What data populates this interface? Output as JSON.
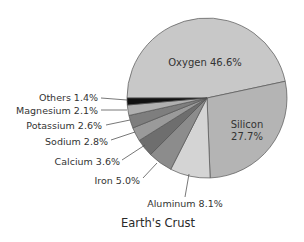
{
  "chart_data": {
    "type": "pie",
    "title": "Earth's Crust",
    "categories": [
      "Oxygen",
      "Silicon",
      "Aluminum",
      "Iron",
      "Calcium",
      "Sodium",
      "Potassium",
      "Magnesium",
      "Others"
    ],
    "values": [
      46.6,
      27.7,
      8.1,
      5.0,
      3.6,
      2.8,
      2.6,
      2.1,
      1.4
    ],
    "unit": "%",
    "labels": [
      "Oxygen 46.6%",
      "Silicon 27.7%",
      "Aluminum 8.1%",
      "Iron 5.0%",
      "Calcium 3.6%",
      "Sodium 2.8%",
      "Potassium 2.6%",
      "Magnesium 2.1%",
      "Others 1.4%"
    ],
    "colors": [
      "#c8c8c8",
      "#b4b4b4",
      "#d4d4d4",
      "#8c8c8c",
      "#6e6e6e",
      "#9a9a9a",
      "#7e7e7e",
      "#b0b0b0",
      "#111111"
    ],
    "legend": "none (callout labels)",
    "start_angle_deg": 180,
    "direction": "clockwise"
  },
  "labels": {
    "oxygen": "Oxygen 46.6%",
    "silicon_name": "Silicon",
    "silicon_value": "27.7%",
    "aluminum": "Aluminum 8.1%",
    "iron": "Iron 5.0%",
    "calcium": "Calcium 3.6%",
    "sodium": "Sodium 2.8%",
    "potassium": "Potassium 2.6%",
    "magnesium": "Magnesium 2.1%",
    "others": "Others 1.4%"
  },
  "title": "Earth's Crust"
}
